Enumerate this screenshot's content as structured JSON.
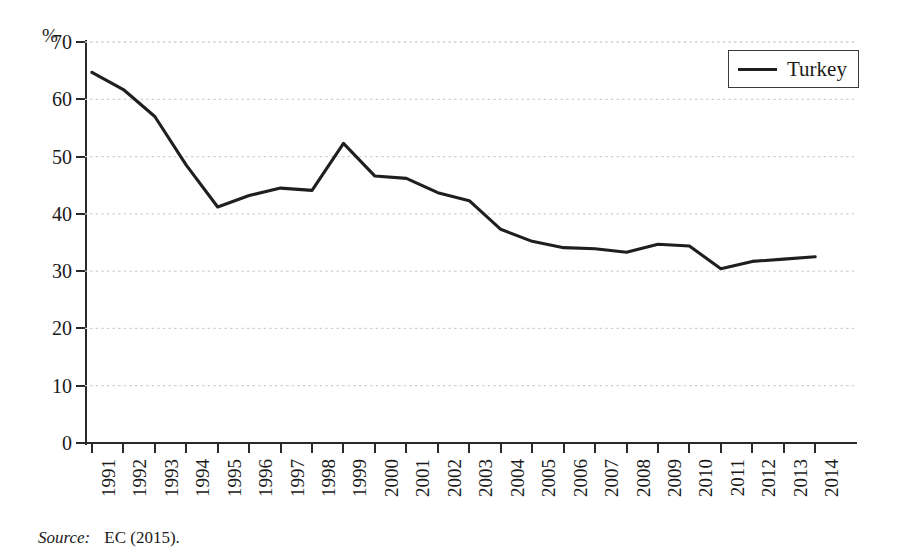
{
  "axis": {
    "unit_label": "%",
    "y_ticks": [
      "0",
      "10",
      "20",
      "30",
      "40",
      "50",
      "60",
      "70"
    ],
    "x_ticks": [
      "1991",
      "1992",
      "1993",
      "1994",
      "1995",
      "1996",
      "1997",
      "1998",
      "1999",
      "2000",
      "2001",
      "2002",
      "2003",
      "2004",
      "2005",
      "2006",
      "2007",
      "2008",
      "2009",
      "2010",
      "2011",
      "2012",
      "2013",
      "2014"
    ]
  },
  "legend": {
    "entries": [
      {
        "label": "Turkey",
        "color": "#1f1f1f"
      }
    ]
  },
  "source": {
    "word": "Source:",
    "text": "EC (2015)."
  },
  "chart_data": {
    "type": "line",
    "title": "",
    "subtitle": "",
    "xlabel": "",
    "ylabel": "%",
    "ylim": [
      0,
      70
    ],
    "ytick_step": 10,
    "grid": true,
    "grid_style": "dotted",
    "grid_color": "#cfcfcf",
    "legend_position": "top-right",
    "x": [
      "1991",
      "1992",
      "1993",
      "1994",
      "1995",
      "1996",
      "1997",
      "1998",
      "1999",
      "2000",
      "2001",
      "2002",
      "2003",
      "2004",
      "2005",
      "2006",
      "2007",
      "2008",
      "2009",
      "2010",
      "2011",
      "2012",
      "2013",
      "2014"
    ],
    "series": [
      {
        "name": "Turkey",
        "color": "#1f1f1f",
        "values": [
          64.7,
          61.7,
          57.0,
          48.5,
          41.2,
          43.2,
          44.5,
          44.1,
          52.3,
          46.6,
          46.2,
          43.7,
          42.3,
          37.3,
          35.2,
          34.1,
          33.9,
          33.3,
          34.7,
          34.4,
          30.4,
          31.7,
          32.1,
          32.5
        ]
      }
    ]
  }
}
